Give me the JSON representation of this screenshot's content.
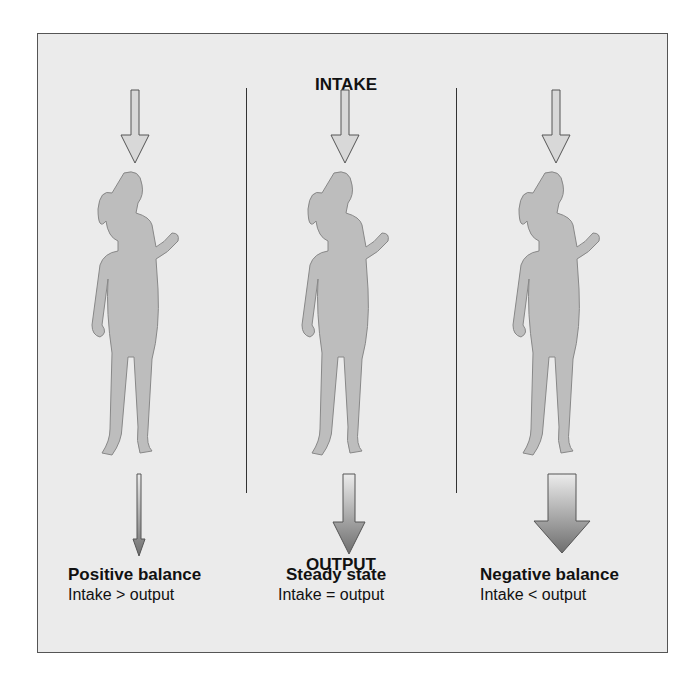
{
  "diagram": {
    "top_label": "INTAKE",
    "bottom_label": "OUTPUT",
    "panels": [
      {
        "title": "Positive balance",
        "subtitle": "Intake > output",
        "output_arrow_size": "small"
      },
      {
        "title": "Steady state",
        "subtitle": "Intake = output",
        "output_arrow_size": "medium"
      },
      {
        "title": "Negative balance",
        "subtitle": "Intake < output",
        "output_arrow_size": "large"
      }
    ],
    "colors": {
      "background": "#ebebeb",
      "figure": "#bdbdbd",
      "arrow_light": "#e0e0e0",
      "arrow_dark": "#6e6e6e"
    }
  }
}
